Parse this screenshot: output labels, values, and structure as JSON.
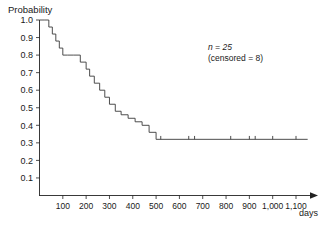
{
  "chart_data": {
    "type": "line",
    "subtype": "kaplan-meier-step",
    "title": "",
    "xlabel": "days",
    "ylabel": "Probability",
    "xlim": [
      0,
      1160
    ],
    "ylim": [
      0,
      1.0
    ],
    "grid": false,
    "legend": null,
    "x_ticks": [
      100,
      200,
      300,
      400,
      500,
      600,
      700,
      800,
      900,
      1000,
      1100
    ],
    "x_tick_labels": [
      "100",
      "200",
      "300",
      "400",
      "500",
      "600",
      "700",
      "800",
      "900",
      "1,000",
      "1,100"
    ],
    "y_ticks": [
      0.1,
      0.2,
      0.3,
      0.4,
      0.5,
      0.6,
      0.7,
      0.8,
      0.9,
      1.0
    ],
    "y_tick_labels": [
      "0.1",
      "0.2",
      "0.3",
      "0.4",
      "0.5",
      "0.6",
      "0.7",
      "0.8",
      "0.9",
      "1.0"
    ],
    "annotations": [
      {
        "name": "sample-size",
        "text": "n = 25",
        "x": 700,
        "y": 0.86
      },
      {
        "name": "censored-count",
        "text": "(censored = 8)",
        "x": 700,
        "y": 0.8
      }
    ],
    "series": [
      {
        "name": "survival",
        "x": [
          0,
          20,
          40,
          55,
          70,
          85,
          100,
          120,
          145,
          175,
          200,
          215,
          235,
          258,
          280,
          300,
          325,
          350,
          380,
          410,
          440,
          470,
          500,
          1150
        ],
        "y": [
          1.0,
          1.0,
          0.96,
          0.92,
          0.88,
          0.84,
          0.8,
          0.8,
          0.8,
          0.76,
          0.72,
          0.68,
          0.64,
          0.6,
          0.56,
          0.52,
          0.48,
          0.46,
          0.44,
          0.42,
          0.4,
          0.36,
          0.32,
          0.32
        ]
      }
    ],
    "censored_marks": [
      {
        "x": 520,
        "y": 0.32
      },
      {
        "x": 640,
        "y": 0.32
      },
      {
        "x": 665,
        "y": 0.32
      },
      {
        "x": 820,
        "y": 0.32
      },
      {
        "x": 900,
        "y": 0.32
      },
      {
        "x": 925,
        "y": 0.32
      },
      {
        "x": 1000,
        "y": 0.32
      },
      {
        "x": 1100,
        "y": 0.32
      }
    ]
  }
}
